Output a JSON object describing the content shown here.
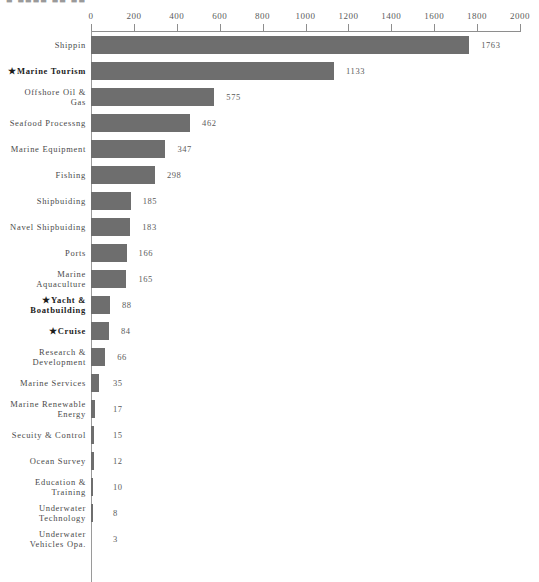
{
  "title_fragment": "■ ■■■■ ■■ ■■",
  "axis": {
    "ticks": [
      0,
      200,
      400,
      600,
      800,
      1000,
      1200,
      1400,
      1600,
      1800,
      2000
    ],
    "min": 0,
    "max": 2000,
    "position": "top"
  },
  "star_glyph": "★",
  "colors": {
    "bar": "#6e6e6e",
    "axis": "#8e8e8e",
    "label": "#4a4a4a",
    "value": "#5b5b5b",
    "starred_label": "#1c1c1c",
    "background": "#ffffff"
  },
  "chart_data": {
    "type": "bar",
    "orientation": "horizontal",
    "title": "",
    "xlabel": "",
    "ylabel": "",
    "xlim": [
      0,
      2000
    ],
    "grid": false,
    "legend": null,
    "categories": [
      "Shippin",
      "Marine Tourism",
      "Offshore Oil &\nGas",
      "Seafood Processng",
      "Marine Equipment",
      "Fishing",
      "Shipbuiding",
      "Navel Shipbuiding",
      "Ports",
      "Marine\nAquaculture",
      "Yacht &\nBoatbuilding",
      "Cruise",
      "Research &\nDevelopment",
      "Marine Services",
      "Marine Renewable\nEnergy",
      "Secuity & Control",
      "Ocean Survey",
      "Education &\nTraining",
      "Underwater\nTechnology",
      "Underwater\nVehicles Opa."
    ],
    "values": [
      1763,
      1133,
      575,
      462,
      347,
      298,
      185,
      183,
      166,
      165,
      88,
      84,
      66,
      35,
      17,
      15,
      12,
      10,
      8,
      3
    ],
    "starred": [
      false,
      true,
      false,
      false,
      false,
      false,
      false,
      false,
      false,
      false,
      true,
      true,
      false,
      false,
      false,
      false,
      false,
      false,
      false,
      false
    ]
  }
}
